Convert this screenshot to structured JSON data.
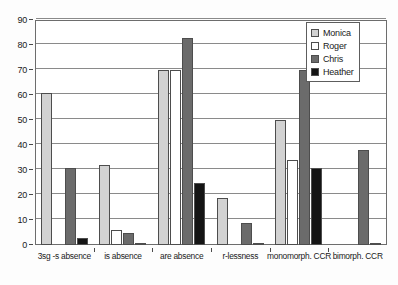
{
  "chart_data": {
    "type": "bar",
    "title": "",
    "subtitle": "",
    "xlabel": "",
    "ylabel": "",
    "ylim": [
      0,
      90
    ],
    "ytick_step": 10,
    "yticks": [
      0,
      10,
      20,
      30,
      40,
      50,
      60,
      70,
      80,
      90
    ],
    "grid": true,
    "legend_position": "top-right",
    "categories": [
      "3sg -s absence",
      "is absence",
      "are absence",
      "r-lessness",
      "monomorph. CCR",
      "bimorph. CCR"
    ],
    "series": [
      {
        "name": "Monica",
        "color": "#d2d2d2",
        "values": [
          61,
          32,
          70,
          19,
          50,
          0
        ]
      },
      {
        "name": "Roger",
        "color": "#ffffff",
        "values": [
          0,
          6,
          70,
          0,
          34,
          0
        ]
      },
      {
        "name": "Chris",
        "color": "#6b6b6b",
        "values": [
          31,
          5,
          83,
          9,
          70,
          38
        ]
      },
      {
        "name": "Heather",
        "color": "#141414",
        "values": [
          3,
          1,
          25,
          1,
          31,
          1
        ]
      }
    ]
  },
  "legend": {
    "items": [
      {
        "label": "Monica"
      },
      {
        "label": "Roger"
      },
      {
        "label": "Chris"
      },
      {
        "label": "Heather"
      }
    ]
  }
}
